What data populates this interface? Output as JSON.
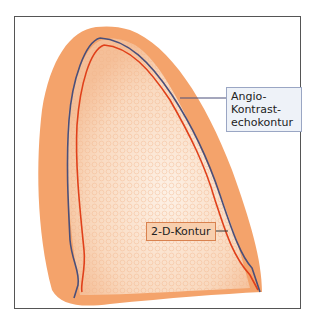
{
  "figure": {
    "labels": {
      "angio": "Angio-Kontrast-echokontur",
      "angio_line1": "Angio-Kontrast-",
      "angio_line2": "echokontur",
      "two_d": "2-D-Kontur"
    },
    "colors": {
      "outer_wall": "#f4a36b",
      "inner_cavity": "#fbe3cf",
      "angio_contour": "#4a4f7a",
      "two_d_contour": "#e0401a",
      "angio_label_bg": "#eef2f8",
      "two_d_label_bg": "#f8cfae"
    }
  }
}
